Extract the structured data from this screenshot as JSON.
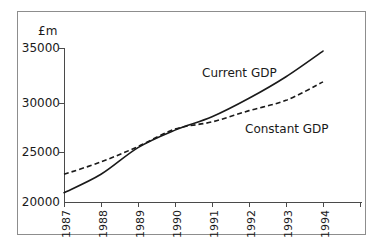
{
  "chart_data": {
    "type": "line",
    "title": "",
    "xlabel": "",
    "ylabel": "£m",
    "ylim": [
      20000,
      35000
    ],
    "yticks": [
      20000,
      25000,
      30000,
      35000
    ],
    "ytick_labels": [
      "20000",
      "25000",
      "30000",
      "35000"
    ],
    "grid": false,
    "legend_position": "inline-annotation",
    "categories": [
      "1987",
      "1988",
      "1989",
      "1990",
      "1991",
      "1992",
      "1993",
      "1994"
    ],
    "x": [
      1987,
      1988,
      1989,
      1990,
      1991,
      1992,
      1993,
      1994
    ],
    "series": [
      {
        "name": "Current GDP",
        "style": "solid",
        "color": "#1a1a1a",
        "values": [
          20900,
          22700,
          25300,
          27000,
          28300,
          30100,
          32200,
          34700
        ]
      },
      {
        "name": "Constant GDP",
        "style": "dashed",
        "color": "#1a1a1a",
        "values": [
          22700,
          23900,
          25400,
          27100,
          27800,
          28900,
          29900,
          31700
        ]
      }
    ],
    "annotations": [
      {
        "text": "Current GDP",
        "series": "Current GDP"
      },
      {
        "text": "Constant GDP",
        "series": "Constant GDP"
      }
    ]
  },
  "axes": {
    "unit_label": "£m",
    "ytick_labels": [
      "35000",
      "30000",
      "25000",
      "20000"
    ],
    "xtick_labels": [
      "1987",
      "1988",
      "1989",
      "1990",
      "1991",
      "1992",
      "1993",
      "1994"
    ]
  },
  "annotations": {
    "current_gdp": "Current GDP",
    "constant_gdp": "Constant GDP"
  },
  "colors": {
    "frame": "#8d8d8d",
    "axis": "#4a4a4a",
    "line": "#1a1a1a",
    "text": "#1a1a1a",
    "background": "#ffffff"
  }
}
